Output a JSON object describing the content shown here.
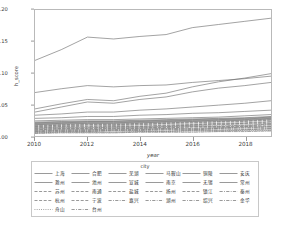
{
  "chart_data": {
    "type": "line",
    "title": "",
    "xlabel": "year",
    "ylabel": "h_score",
    "xlim": [
      2010,
      2019
    ],
    "ylim": [
      0.0,
      0.2
    ],
    "xticks": [
      "2010",
      "2012",
      "2014",
      "2016",
      "2018"
    ],
    "xtick_values": [
      2010,
      2012,
      2014,
      2016,
      2018
    ],
    "yticks": [
      "0.00",
      "0.05",
      "0.10",
      "0.15",
      "0.20"
    ],
    "ytick_values": [
      0.0,
      0.05,
      0.1,
      0.15,
      0.2
    ],
    "grid": false,
    "legend_position": "below",
    "legend_title": "city",
    "x": [
      2010,
      2011,
      2012,
      2013,
      2014,
      2015,
      2016,
      2017,
      2018,
      2019
    ],
    "series": [
      {
        "name": "上海",
        "dash": "solid",
        "values": [
          0.12,
          0.137,
          0.157,
          0.154,
          0.158,
          0.161,
          0.172,
          0.177,
          0.182,
          0.187
        ]
      },
      {
        "name": "合肥",
        "dash": "solid",
        "values": [
          0.043,
          0.051,
          0.058,
          0.056,
          0.063,
          0.068,
          0.078,
          0.086,
          0.092,
          0.099
        ]
      },
      {
        "name": "芜湖",
        "dash": "solid",
        "values": [
          0.069,
          0.075,
          0.08,
          0.078,
          0.08,
          0.081,
          0.085,
          0.088,
          0.091,
          0.095
        ]
      },
      {
        "name": "马鞍山",
        "dash": "solid",
        "values": [
          0.038,
          0.046,
          0.054,
          0.052,
          0.058,
          0.062,
          0.07,
          0.076,
          0.08,
          0.085
        ]
      },
      {
        "name": "铜陵",
        "dash": "solid",
        "values": [
          0.033,
          0.035,
          0.038,
          0.038,
          0.041,
          0.043,
          0.046,
          0.049,
          0.052,
          0.056
        ]
      },
      {
        "name": "安庆",
        "dash": "solid",
        "values": [
          0.028,
          0.029,
          0.031,
          0.031,
          0.033,
          0.034,
          0.036,
          0.037,
          0.039,
          0.041
        ]
      },
      {
        "name": "滁州",
        "dash": "solid",
        "values": [
          0.024,
          0.025,
          0.026,
          0.026,
          0.027,
          0.028,
          0.029,
          0.03,
          0.032,
          0.034
        ]
      },
      {
        "name": "池州",
        "dash": "solid",
        "values": [
          0.022,
          0.023,
          0.024,
          0.024,
          0.025,
          0.026,
          0.027,
          0.028,
          0.029,
          0.031
        ]
      },
      {
        "name": "宣城",
        "dash": "solid",
        "values": [
          0.021,
          0.022,
          0.023,
          0.023,
          0.024,
          0.025,
          0.026,
          0.027,
          0.028,
          0.03
        ]
      },
      {
        "name": "南京",
        "dash": "solid",
        "values": [
          0.02,
          0.021,
          0.022,
          0.022,
          0.023,
          0.024,
          0.025,
          0.026,
          0.027,
          0.029
        ]
      },
      {
        "name": "无锡",
        "dash": "solid",
        "values": [
          0.019,
          0.02,
          0.021,
          0.021,
          0.022,
          0.023,
          0.024,
          0.025,
          0.026,
          0.028
        ]
      },
      {
        "name": "常州",
        "dash": "solid",
        "values": [
          0.018,
          0.019,
          0.02,
          0.02,
          0.021,
          0.022,
          0.023,
          0.024,
          0.025,
          0.027
        ]
      },
      {
        "name": "苏州",
        "dash": "dashed",
        "values": [
          0.017,
          0.018,
          0.019,
          0.019,
          0.02,
          0.021,
          0.022,
          0.023,
          0.024,
          0.026
        ]
      },
      {
        "name": "南通",
        "dash": "dashed",
        "values": [
          0.016,
          0.017,
          0.018,
          0.018,
          0.019,
          0.02,
          0.021,
          0.022,
          0.023,
          0.025
        ]
      },
      {
        "name": "盐城",
        "dash": "dashed",
        "values": [
          0.015,
          0.016,
          0.017,
          0.017,
          0.018,
          0.019,
          0.019,
          0.02,
          0.021,
          0.023
        ]
      },
      {
        "name": "扬州",
        "dash": "dashed",
        "values": [
          0.014,
          0.015,
          0.015,
          0.016,
          0.016,
          0.017,
          0.018,
          0.019,
          0.02,
          0.022
        ]
      },
      {
        "name": "镇江",
        "dash": "dashed",
        "values": [
          0.013,
          0.014,
          0.014,
          0.015,
          0.015,
          0.016,
          0.017,
          0.018,
          0.019,
          0.02
        ]
      },
      {
        "name": "泰州",
        "dash": "dashdot",
        "values": [
          0.012,
          0.013,
          0.013,
          0.014,
          0.014,
          0.015,
          0.016,
          0.016,
          0.017,
          0.019
        ]
      },
      {
        "name": "杭州",
        "dash": "dashed",
        "values": [
          0.011,
          0.012,
          0.012,
          0.013,
          0.013,
          0.014,
          0.015,
          0.015,
          0.016,
          0.018
        ]
      },
      {
        "name": "宁波",
        "dash": "dashed",
        "values": [
          0.01,
          0.011,
          0.011,
          0.012,
          0.012,
          0.013,
          0.014,
          0.014,
          0.015,
          0.016
        ]
      },
      {
        "name": "嘉兴",
        "dash": "dashdot",
        "values": [
          0.009,
          0.01,
          0.01,
          0.011,
          0.011,
          0.012,
          0.012,
          0.013,
          0.014,
          0.015
        ]
      },
      {
        "name": "湖州",
        "dash": "dashdot",
        "values": [
          0.008,
          0.009,
          0.009,
          0.01,
          0.01,
          0.011,
          0.011,
          0.012,
          0.013,
          0.014
        ]
      },
      {
        "name": "绍兴",
        "dash": "dashdot",
        "values": [
          0.007,
          0.008,
          0.008,
          0.009,
          0.009,
          0.01,
          0.01,
          0.011,
          0.011,
          0.012
        ]
      },
      {
        "name": "金华",
        "dash": "dashdot",
        "values": [
          0.006,
          0.007,
          0.007,
          0.008,
          0.008,
          0.008,
          0.009,
          0.009,
          0.01,
          0.011
        ]
      },
      {
        "name": "舟山",
        "dash": "dotted",
        "values": [
          0.005,
          0.006,
          0.006,
          0.006,
          0.007,
          0.007,
          0.008,
          0.008,
          0.009,
          0.009
        ]
      },
      {
        "name": "台州",
        "dash": "dashdot",
        "values": [
          0.004,
          0.005,
          0.005,
          0.005,
          0.006,
          0.006,
          0.006,
          0.007,
          0.007,
          0.008
        ]
      }
    ]
  },
  "legend": {
    "title": "city",
    "rows": [
      [
        "上海",
        "合肥",
        "芜湖",
        "马鞍山",
        "铜陵",
        "安庆"
      ],
      [
        "滁州",
        "池州",
        "宣城",
        "南京",
        "无锡",
        "常州"
      ],
      [
        "苏州",
        "南通",
        "盐城",
        "扬州",
        "镇江",
        "泰州"
      ],
      [
        "杭州",
        "宁波",
        "嘉兴",
        "湖州",
        "绍兴",
        "金华"
      ],
      [
        "舟山",
        "台州",
        "",
        "",
        "",
        ""
      ]
    ]
  },
  "colors": {
    "axis": "#b9b9b9",
    "tick_text": "#3a3a3a",
    "background": "#ffffff",
    "line_default": "#6f6f6f"
  }
}
